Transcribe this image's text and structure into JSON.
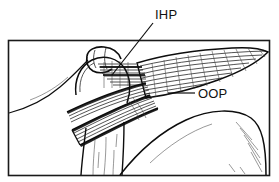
{
  "figure": {
    "type": "anatomical-line-drawing",
    "frame": {
      "x": 8,
      "y": 40,
      "width": 262,
      "height": 136,
      "border_color": "#1a1a1a",
      "background_color": "#ffffff"
    },
    "ink_color": "#0d0d0d",
    "labels": [
      {
        "id": "ihp",
        "text": "IHP",
        "x": 155,
        "y": 19,
        "leader": {
          "from_x": 153,
          "from_y": 23,
          "to_x": 112,
          "to_y": 75
        }
      },
      {
        "id": "oop",
        "text": "OOP",
        "x": 198,
        "y": 98,
        "leader": {
          "from_x": 195,
          "from_y": 93,
          "to_x": 168,
          "to_y": 93
        }
      }
    ]
  }
}
